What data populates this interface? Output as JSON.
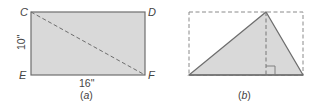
{
  "colors": {
    "fill": "#d9d9d9",
    "stroke": "#6e6e6e",
    "dash": "#8a8a8a",
    "text": "#444444"
  },
  "panel_a": {
    "vertices": {
      "top_left": "C",
      "top_right": "D",
      "bottom_left": "E",
      "bottom_right": "F"
    },
    "height_label": "10\"",
    "width_label": "16\"",
    "caption_prefix": "(",
    "caption_letter": "a",
    "caption_suffix": ")"
  },
  "panel_b": {
    "caption_prefix": "(",
    "caption_letter": "b",
    "caption_suffix": ")"
  }
}
